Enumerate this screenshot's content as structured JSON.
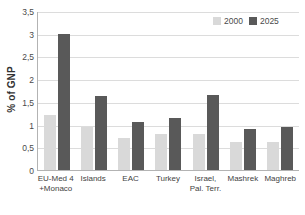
{
  "chart_data": {
    "type": "bar",
    "title": "",
    "xlabel": "",
    "ylabel": "% of GNP",
    "ylim": [
      0,
      3.5
    ],
    "ytick_labels": [
      "3,5",
      "3",
      "2,5",
      "2",
      "1,5",
      "1",
      "0,5",
      "0"
    ],
    "ytick_values": [
      3.5,
      3,
      2.5,
      2,
      1.5,
      1,
      0.5,
      0
    ],
    "grid": true,
    "legend_position": "top-right",
    "categories": [
      "EU-Med 4 +Monaco",
      "Islands",
      "EAC",
      "Turkey",
      "Israel, Pal. Terr.",
      "Mashrek",
      "Maghreb"
    ],
    "category_lines": [
      [
        "EU-Med 4",
        "+Monaco"
      ],
      [
        "Islands",
        ""
      ],
      [
        "EAC",
        ""
      ],
      [
        "Turkey",
        ""
      ],
      [
        "Israel,",
        "Pal. Terr."
      ],
      [
        "Mashrek",
        ""
      ],
      [
        "Maghreb",
        ""
      ]
    ],
    "series": [
      {
        "name": "2000",
        "color": "#d9d9d9",
        "values": [
          1.22,
          0.95,
          0.71,
          0.8,
          0.79,
          0.61,
          0.61
        ]
      },
      {
        "name": "2025",
        "color": "#595959",
        "values": [
          3.0,
          1.62,
          1.05,
          1.15,
          1.65,
          0.91,
          0.94
        ]
      }
    ]
  },
  "legend": {
    "entries": [
      {
        "label": "2000"
      },
      {
        "label": "2025"
      }
    ]
  },
  "colors": {
    "series_2000": "#d9d9d9",
    "series_2025": "#595959",
    "gridline": "#dcdcdc",
    "axis": "#b3b3b3",
    "background": "#ffffff"
  }
}
